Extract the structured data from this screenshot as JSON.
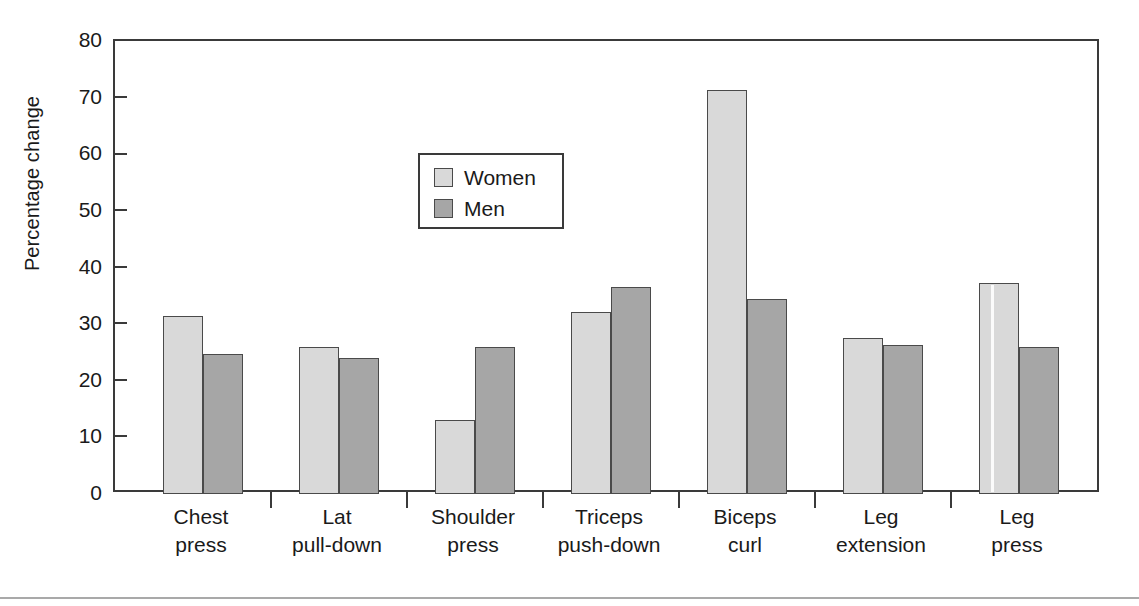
{
  "chart_data": {
    "type": "bar",
    "title": "",
    "xlabel": "",
    "ylabel": "Percentage change",
    "ylim": [
      0,
      80
    ],
    "ytick_values": [
      0,
      10,
      20,
      30,
      40,
      50,
      60,
      70,
      80
    ],
    "ytick_labels": [
      "0",
      "10",
      "20",
      "30",
      "40",
      "50",
      "60",
      "70",
      "80"
    ],
    "grid": false,
    "legend_position": "upper-left-inside",
    "categories": [
      "Chest press",
      "Lat pull-down",
      "Shoulder press",
      "Triceps push-down",
      "Biceps curl",
      "Leg extension",
      "Leg press"
    ],
    "category_lines": [
      [
        "Chest",
        "press"
      ],
      [
        "Lat",
        "pull-down"
      ],
      [
        "Shoulder",
        "press"
      ],
      [
        "Triceps",
        "push-down"
      ],
      [
        "Biceps",
        "curl"
      ],
      [
        "Leg",
        "extension"
      ],
      [
        "Leg",
        "press"
      ]
    ],
    "series": [
      {
        "name": "Women",
        "color": "#d9d9d9",
        "values": [
          31.5,
          26.0,
          13.0,
          32.2,
          71.4,
          27.6,
          37.2
        ]
      },
      {
        "name": "Men",
        "color": "#a6a6a6",
        "values": [
          24.8,
          24.1,
          26.0,
          36.6,
          34.4,
          26.3,
          26.0
        ]
      }
    ]
  },
  "legend": {
    "items": [
      {
        "label": "Women",
        "color": "#d9d9d9"
      },
      {
        "label": "Men",
        "color": "#a6a6a6"
      }
    ]
  },
  "axes": {
    "y_title": "Percentage change",
    "y_labels": [
      "80",
      "70",
      "60",
      "50",
      "40",
      "30",
      "20",
      "10",
      "0"
    ]
  },
  "colors": {
    "women_fill": "#d9d9d9",
    "men_fill": "#a6a6a6",
    "bar_stroke": "#4a4a4a",
    "axis": "#3a3a3a",
    "text": "#1a1a1a",
    "background": "#ffffff",
    "rule": "#a9a9a9"
  }
}
